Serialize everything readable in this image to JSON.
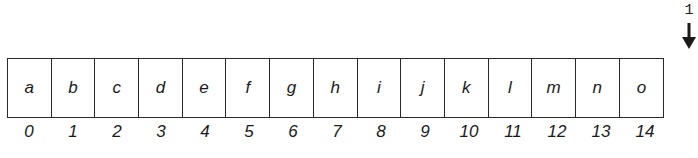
{
  "array": {
    "cells": [
      "a",
      "b",
      "c",
      "d",
      "e",
      "f",
      "g",
      "h",
      "i",
      "j",
      "k",
      "l",
      "m",
      "n",
      "o"
    ],
    "indices": [
      "0",
      "1",
      "2",
      "3",
      "4",
      "5",
      "6",
      "7",
      "8",
      "9",
      "10",
      "11",
      "12",
      "13",
      "14"
    ]
  },
  "pointer": {
    "label": "1",
    "icon": "down-arrow-icon"
  }
}
